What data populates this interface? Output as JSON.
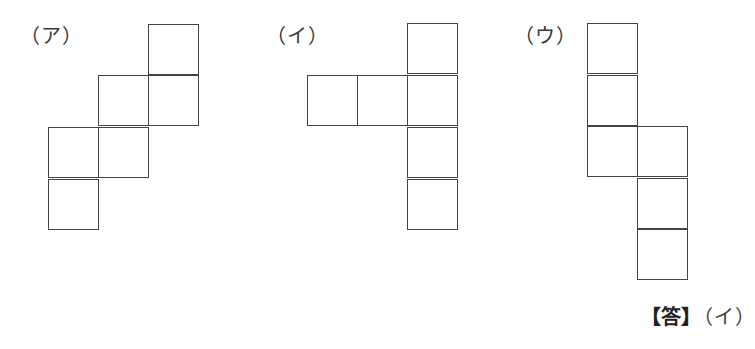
{
  "figures": [
    {
      "id": "a",
      "label": "（ア）",
      "label_pos": [
        20,
        24
      ],
      "cells": [
        [
          148,
          24
        ],
        [
          98,
          75
        ],
        [
          148,
          75
        ],
        [
          48,
          127
        ],
        [
          98,
          127
        ],
        [
          48,
          179
        ]
      ]
    },
    {
      "id": "i",
      "label": "（イ）",
      "label_pos": [
        266,
        24
      ],
      "cells": [
        [
          407,
          23
        ],
        [
          307,
          75
        ],
        [
          357,
          75
        ],
        [
          407,
          75
        ],
        [
          407,
          127
        ],
        [
          407,
          179
        ]
      ]
    },
    {
      "id": "u",
      "label": "（ウ）",
      "label_pos": [
        514,
        24
      ],
      "cells": [
        [
          587,
          23
        ],
        [
          587,
          75
        ],
        [
          587,
          126
        ],
        [
          637,
          126
        ],
        [
          637,
          178
        ],
        [
          637,
          229
        ]
      ]
    }
  ],
  "cell_size": 51,
  "answer": {
    "key": "【答】",
    "value": "（イ）"
  }
}
